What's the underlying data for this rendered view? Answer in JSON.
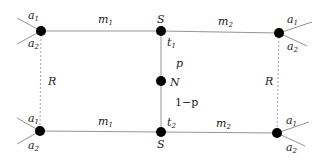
{
  "diagram": {
    "type": "network-graph",
    "nodes": [
      {
        "id": "TL",
        "x": 41,
        "y": 31,
        "label_top": "a",
        "label_top_sub": "1",
        "label_bottom": "a",
        "label_bottom_sub": "2"
      },
      {
        "id": "TS",
        "x": 161,
        "y": 31,
        "label": "S",
        "sublabel": "t",
        "sublabel_sub": "1"
      },
      {
        "id": "TR",
        "x": 279,
        "y": 33,
        "label_top": "a",
        "label_top_sub": "1",
        "label_bottom": "a",
        "label_bottom_sub": "2"
      },
      {
        "id": "N",
        "x": 161,
        "y": 81,
        "label": "N"
      },
      {
        "id": "BL",
        "x": 40,
        "y": 131,
        "label_top": "a",
        "label_top_sub": "1",
        "label_bottom": "a",
        "label_bottom_sub": "2"
      },
      {
        "id": "BS",
        "x": 161,
        "y": 132,
        "label": "S",
        "sublabel": "t",
        "sublabel_sub": "2"
      },
      {
        "id": "BR",
        "x": 277,
        "y": 133,
        "label_top": "a",
        "label_top_sub": "1",
        "label_bottom": "a",
        "label_bottom_sub": "2"
      }
    ],
    "edges": {
      "top_left": {
        "label": "m",
        "sub": "1"
      },
      "top_right": {
        "label": "m",
        "sub": "2"
      },
      "bot_left": {
        "label": "m",
        "sub": "1"
      },
      "bot_right": {
        "label": "m",
        "sub": "2"
      },
      "upper_vertical": {
        "label": "p"
      },
      "lower_vertical": {
        "label": "1−p"
      },
      "left_dashed": {
        "label": "R"
      },
      "right_dashed": {
        "label": "R"
      }
    },
    "colors": {
      "node": "#000000",
      "edge": "#888888",
      "dashed": "#999999",
      "text": "#222222"
    }
  }
}
